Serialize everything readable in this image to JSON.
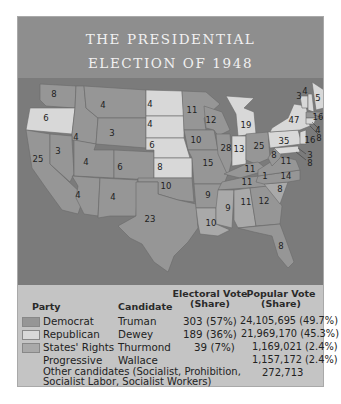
{
  "title": {
    "line1": "THE PRESIDENTIAL",
    "line2": "ELECTION OF 1948"
  },
  "colors": {
    "header_bg": "#8e8e8e",
    "ocean": "#7b7b7b",
    "democrat": "#969696",
    "republican": "#d8d8d8",
    "states_rights": "#a9a9a9",
    "legend_bg": "#c4c4c4"
  },
  "map": {
    "states": [
      {
        "abbr": "WA",
        "ev": "8",
        "party": "democrat"
      },
      {
        "abbr": "OR",
        "ev": "6",
        "party": "republican"
      },
      {
        "abbr": "CA",
        "ev": "25",
        "party": "democrat"
      },
      {
        "abbr": "ID",
        "ev": "4",
        "party": "democrat"
      },
      {
        "abbr": "NV",
        "ev": "3",
        "party": "democrat"
      },
      {
        "abbr": "MT",
        "ev": "4",
        "party": "democrat"
      },
      {
        "abbr": "WY",
        "ev": "3",
        "party": "democrat"
      },
      {
        "abbr": "UT",
        "ev": "4",
        "party": "democrat"
      },
      {
        "abbr": "CO",
        "ev": "6",
        "party": "democrat"
      },
      {
        "abbr": "AZ",
        "ev": "4",
        "party": "democrat"
      },
      {
        "abbr": "NM",
        "ev": "4",
        "party": "democrat"
      },
      {
        "abbr": "ND",
        "ev": "4",
        "party": "republican"
      },
      {
        "abbr": "SD",
        "ev": "4",
        "party": "republican"
      },
      {
        "abbr": "NE",
        "ev": "6",
        "party": "republican"
      },
      {
        "abbr": "KS",
        "ev": "8",
        "party": "republican"
      },
      {
        "abbr": "OK",
        "ev": "10",
        "party": "democrat"
      },
      {
        "abbr": "TX",
        "ev": "23",
        "party": "democrat"
      },
      {
        "abbr": "MN",
        "ev": "11",
        "party": "democrat"
      },
      {
        "abbr": "IA",
        "ev": "10",
        "party": "democrat"
      },
      {
        "abbr": "MO",
        "ev": "15",
        "party": "democrat"
      },
      {
        "abbr": "AR",
        "ev": "9",
        "party": "democrat"
      },
      {
        "abbr": "LA",
        "ev": "10",
        "party": "states_rights"
      },
      {
        "abbr": "WI",
        "ev": "12",
        "party": "democrat"
      },
      {
        "abbr": "IL",
        "ev": "28",
        "party": "democrat"
      },
      {
        "abbr": "MI",
        "ev": "19",
        "party": "republican"
      },
      {
        "abbr": "IN",
        "ev": "13",
        "party": "republican"
      },
      {
        "abbr": "OH",
        "ev": "25",
        "party": "democrat"
      },
      {
        "abbr": "KY",
        "ev": "11",
        "party": "democrat"
      },
      {
        "abbr": "TN",
        "ev": "11",
        "party": "democrat"
      },
      {
        "abbr": "TN-split",
        "ev": "1",
        "party": "states_rights"
      },
      {
        "abbr": "MS",
        "ev": "9",
        "party": "states_rights"
      },
      {
        "abbr": "AL",
        "ev": "11",
        "party": "states_rights"
      },
      {
        "abbr": "GA",
        "ev": "12",
        "party": "democrat"
      },
      {
        "abbr": "FL",
        "ev": "8",
        "party": "democrat"
      },
      {
        "abbr": "SC",
        "ev": "8",
        "party": "states_rights"
      },
      {
        "abbr": "NC",
        "ev": "14",
        "party": "democrat"
      },
      {
        "abbr": "VA",
        "ev": "11",
        "party": "democrat"
      },
      {
        "abbr": "WV",
        "ev": "8",
        "party": "democrat"
      },
      {
        "abbr": "PA",
        "ev": "35",
        "party": "republican"
      },
      {
        "abbr": "NY",
        "ev": "47",
        "party": "republican"
      },
      {
        "abbr": "VT",
        "ev": "3",
        "party": "republican"
      },
      {
        "abbr": "NH",
        "ev": "4",
        "party": "republican"
      },
      {
        "abbr": "ME",
        "ev": "5",
        "party": "republican"
      },
      {
        "abbr": "MA",
        "ev": "16",
        "party": "democrat"
      },
      {
        "abbr": "RI",
        "ev": "4",
        "party": "democrat"
      },
      {
        "abbr": "CT",
        "ev": "8",
        "party": "republican"
      },
      {
        "abbr": "NJ",
        "ev": "16",
        "party": "republican"
      },
      {
        "abbr": "DE",
        "ev": "3",
        "party": "republican"
      },
      {
        "abbr": "MD",
        "ev": "8",
        "party": "republican"
      }
    ]
  },
  "legend": {
    "headers": {
      "party": "Party",
      "candidate": "Candidate",
      "electoral_l1": "Electoral Vote",
      "electoral_l2": "(Share)",
      "popular_l1": "Popular Vote",
      "popular_l2": "(Share)"
    },
    "rows": [
      {
        "party": "Democrat",
        "candidate": "Truman",
        "electoral": "303 (57%)",
        "popular": "24,105,695 (49.7%)"
      },
      {
        "party": "Republican",
        "candidate": "Dewey",
        "electoral": "189 (36%)",
        "popular": "21,969,170 (45.3%)"
      },
      {
        "party": "States' Rights",
        "candidate": "Thurmond",
        "electoral": "39 (7%)",
        "popular": "1,169,021 (2.4%)"
      },
      {
        "party": "Progressive",
        "candidate": "Wallace",
        "electoral": "",
        "popular": "1,157,172 (2.4%)"
      }
    ],
    "other": {
      "line1": "Other candidates (Socialist, Prohibition,",
      "line2": "Socialist Labor, Socialist Workers)",
      "popular": "272,713"
    }
  }
}
